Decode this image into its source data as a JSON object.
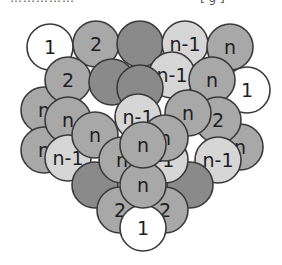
{
  "caption": {
    "left_text": "……………",
    "right_text": "[ g ]"
  },
  "diagram": {
    "shades": {
      "white": "#ffffff",
      "light": "#d6d6d6",
      "mid": "#a8a8a8",
      "dark": "#8a8a8a"
    },
    "balls": [
      {
        "x": 50,
        "y": 47,
        "label": "1",
        "shade": "white"
      },
      {
        "x": 96,
        "y": 44,
        "label": "2",
        "shade": "mid"
      },
      {
        "x": 140,
        "y": 44,
        "label": "",
        "shade": "dark"
      },
      {
        "x": 185,
        "y": 44,
        "label": "n-1",
        "shade": "light"
      },
      {
        "x": 230,
        "y": 47,
        "label": "n",
        "shade": "mid"
      },
      {
        "x": 247,
        "y": 90,
        "label": "1",
        "shade": "white"
      },
      {
        "x": 44,
        "y": 110,
        "label": "n",
        "shade": "mid"
      },
      {
        "x": 44,
        "y": 150,
        "label": "n",
        "shade": "mid"
      },
      {
        "x": 240,
        "y": 147,
        "label": "n",
        "shade": "mid"
      },
      {
        "x": 68,
        "y": 80,
        "label": "2",
        "shade": "mid"
      },
      {
        "x": 112,
        "y": 82,
        "label": "",
        "shade": "dark"
      },
      {
        "x": 172,
        "y": 75,
        "label": "n-1",
        "shade": "light"
      },
      {
        "x": 212,
        "y": 80,
        "label": "n",
        "shade": "mid"
      },
      {
        "x": 218,
        "y": 120,
        "label": "2",
        "shade": "mid"
      },
      {
        "x": 68,
        "y": 120,
        "label": "n",
        "shade": "mid"
      },
      {
        "x": 140,
        "y": 88,
        "label": "",
        "shade": "dark"
      },
      {
        "x": 68,
        "y": 158,
        "label": "n-1",
        "shade": "light"
      },
      {
        "x": 218,
        "y": 160,
        "label": "n-1",
        "shade": "light"
      },
      {
        "x": 95,
        "y": 185,
        "label": "",
        "shade": "dark"
      },
      {
        "x": 190,
        "y": 185,
        "label": "",
        "shade": "dark"
      },
      {
        "x": 95,
        "y": 135,
        "label": "n",
        "shade": "mid"
      },
      {
        "x": 145,
        "y": 152,
        "label": "",
        "shade": "dark"
      },
      {
        "x": 188,
        "y": 113,
        "label": "n",
        "shade": "mid"
      },
      {
        "x": 120,
        "y": 210,
        "label": "2",
        "shade": "mid"
      },
      {
        "x": 165,
        "y": 210,
        "label": "2",
        "shade": "mid"
      },
      {
        "x": 122,
        "y": 160,
        "label": "n",
        "shade": "mid"
      },
      {
        "x": 165,
        "y": 160,
        "label": "-1",
        "shade": "light"
      },
      {
        "x": 138,
        "y": 117,
        "label": "n-1",
        "shade": "light"
      },
      {
        "x": 165,
        "y": 138,
        "label": "n",
        "shade": "mid"
      },
      {
        "x": 143,
        "y": 228,
        "label": "1",
        "shade": "white"
      },
      {
        "x": 143,
        "y": 185,
        "label": "n",
        "shade": "mid"
      },
      {
        "x": 143,
        "y": 145,
        "label": "n",
        "shade": "mid"
      }
    ]
  }
}
